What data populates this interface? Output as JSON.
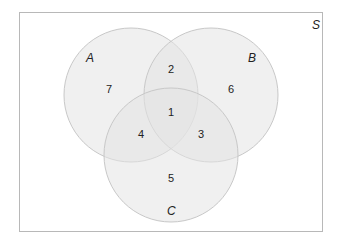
{
  "universe_label": "S",
  "sets": [
    {
      "id": "A",
      "label": "A"
    },
    {
      "id": "B",
      "label": "B"
    },
    {
      "id": "C",
      "label": "C"
    }
  ],
  "regions": {
    "A_only": "7",
    "A_B_only": "2",
    "B_only": "6",
    "A_B_C": "1",
    "A_C_only": "4",
    "B_C_only": "3",
    "C_only": "5"
  },
  "colors": {
    "fill": "#e9e9e9",
    "stroke": "#c8c8c8",
    "frame": "#b8b8b8"
  }
}
